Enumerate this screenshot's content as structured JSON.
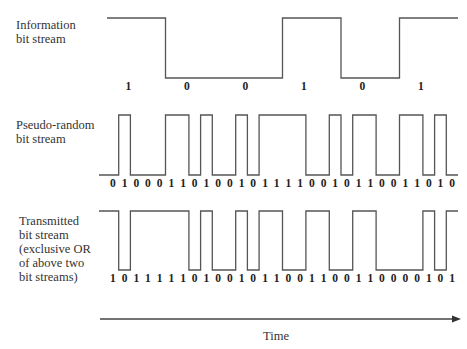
{
  "rows": [
    {
      "id": "information",
      "label_lines": [
        "Information",
        "bit stream"
      ],
      "bits": [
        1,
        0,
        0,
        1,
        0,
        1
      ],
      "chips_per_bit": 5
    },
    {
      "id": "pseudo-random",
      "label_lines": [
        "Pseudo-random",
        "bit stream"
      ],
      "bits": [
        0,
        1,
        0,
        0,
        0,
        1,
        1,
        0,
        1,
        0,
        0,
        1,
        0,
        1,
        1,
        1,
        1,
        0,
        0,
        1,
        0,
        1,
        1,
        0,
        0,
        1,
        1,
        0,
        1,
        0
      ],
      "chips_per_bit": 1
    },
    {
      "id": "transmitted",
      "label_lines": [
        "Transmitted",
        "bit stream",
        "(exclusive OR",
        "of above two",
        "bit streams)"
      ],
      "bits": [
        1,
        0,
        1,
        1,
        1,
        1,
        1,
        0,
        1,
        0,
        0,
        1,
        0,
        1,
        1,
        0,
        0,
        1,
        1,
        0,
        0,
        1,
        1,
        0,
        0,
        0,
        0,
        1,
        0,
        1
      ],
      "chips_per_bit": 1
    }
  ],
  "axis": {
    "label": "Time"
  },
  "colors": {
    "line": "#555555",
    "text": "#222222"
  }
}
